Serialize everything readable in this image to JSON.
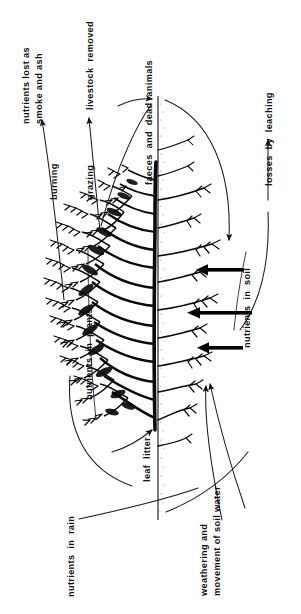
{
  "diagram": {
    "orientation": "rotated-90-ccw",
    "background_color": "#ffffff",
    "ink_color": "#000000",
    "labels": {
      "nutrients_lost": "nutrients lost as\nsmoke and ash",
      "nutrients_lost_line1": "nutrients lost as",
      "nutrients_lost_line2": "smoke and ash",
      "burning": "burning",
      "grazing": "grazing",
      "livestock_removed": "livestock  removed",
      "nutrients_in_plants": "nutrients  in  plants",
      "faeces_and_dead_animals": "faeces  and  dead  animals",
      "nutrients_in_soil": "nutrients  in  soil",
      "losses_by_leaching": "losses  by  leaching",
      "leaf_litter": "leaf  litter",
      "nutrients_in_rain": "nutrients  in  rain",
      "weathering_line1": "weathering and",
      "weathering_line2": "movement of soil water"
    },
    "flows": [
      {
        "id": "flow-burning",
        "from": "nutrients in plants",
        "to": "nutrients lost as smoke and ash",
        "label": "burning",
        "style": "curved-arrow"
      },
      {
        "id": "flow-grazing",
        "from": "nutrients in plants",
        "to": "livestock removed",
        "label": "grazing",
        "style": "curved-arrow"
      },
      {
        "id": "flow-faeces",
        "from": "livestock",
        "to": "soil surface",
        "label": "faeces and dead animals",
        "style": "curved-arrow"
      },
      {
        "id": "flow-leaching",
        "from": "nutrients in soil",
        "to": "losses by leaching",
        "label": "losses by leaching",
        "style": "curved-arrow"
      },
      {
        "id": "flow-uptake-1",
        "from": "nutrients in soil",
        "to": "roots",
        "label": "",
        "style": "thick-arrow"
      },
      {
        "id": "flow-uptake-2",
        "from": "nutrients in soil",
        "to": "roots",
        "label": "",
        "style": "thick-arrow"
      },
      {
        "id": "flow-uptake-3",
        "from": "nutrients in soil",
        "to": "roots",
        "label": "",
        "style": "thick-arrow"
      },
      {
        "id": "flow-litterfall",
        "from": "canopy",
        "to": "leaf litter",
        "label": "leaf litter",
        "style": "curved-arrow"
      },
      {
        "id": "flow-rain",
        "from": "nutrients in rain",
        "to": "soil",
        "label": "nutrients in rain",
        "style": "curved-line"
      },
      {
        "id": "flow-weathering",
        "from": "parent material",
        "to": "nutrients in soil",
        "label": "weathering and movement of soil water",
        "style": "curved-arrow"
      },
      {
        "id": "flow-soilwater",
        "from": "soil water",
        "to": "nutrients in soil",
        "label": "",
        "style": "curved-arrow"
      }
    ],
    "pools": [
      {
        "id": "pool-plants",
        "label": "nutrients  in  plants"
      },
      {
        "id": "pool-soil",
        "label": "nutrients  in  soil"
      },
      {
        "id": "pool-litter",
        "label": "leaf  litter"
      }
    ]
  }
}
